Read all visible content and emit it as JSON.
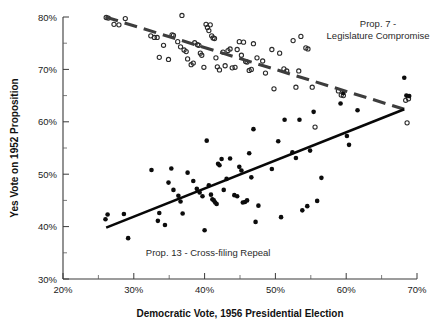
{
  "chart_data": {
    "type": "scatter",
    "title": "",
    "xlabel": "Democratic Vote, 1956 Presidential Election",
    "ylabel": "Yes Vote on 1952 Proposition",
    "xlim": [
      20,
      70
    ],
    "ylim": [
      30,
      80
    ],
    "x_ticks": [
      "20%",
      "30%",
      "40%",
      "50%",
      "60%",
      "70%"
    ],
    "x_tick_values": [
      20,
      30,
      40,
      50,
      60,
      70
    ],
    "x_minor_tick_values": [
      25,
      35,
      45,
      55,
      65
    ],
    "y_ticks": [
      "30%",
      "40%",
      "50%",
      "60%",
      "70%",
      "80%"
    ],
    "y_tick_values": [
      30,
      40,
      50,
      60,
      70,
      80
    ],
    "y_minor_tick_values": [
      35,
      45,
      55,
      65,
      75
    ],
    "grid": false,
    "legend_position": "none",
    "annotations": [
      {
        "name": "prop7-label",
        "lines": [
          "Prop. 7 -",
          "Legislature Compromise"
        ],
        "x": 64.5,
        "y": 78.0,
        "anchor": "middle"
      },
      {
        "name": "prop13-label",
        "lines": [
          "Prop. 13 - Cross-filing Repeal"
        ],
        "x": 40.5,
        "y": 34.3,
        "anchor": "middle"
      }
    ],
    "series": [
      {
        "name": "Prop. 7 - Legislature Compromise",
        "marker": "open-circle",
        "color": "#2b2b2b",
        "points": [
          [
            26.1,
            79.9
          ],
          [
            26.4,
            79.8
          ],
          [
            27.2,
            78.6
          ],
          [
            27.9,
            78.5
          ],
          [
            28.8,
            79.7
          ],
          [
            32.4,
            76.4
          ],
          [
            32.9,
            76.1
          ],
          [
            33.3,
            76.1
          ],
          [
            33.6,
            72.3
          ],
          [
            34.2,
            74.6
          ],
          [
            34.9,
            71.9
          ],
          [
            35.4,
            76.6
          ],
          [
            35.6,
            76.5
          ],
          [
            36.2,
            75.3
          ],
          [
            36.6,
            74.3
          ],
          [
            36.8,
            80.3
          ],
          [
            37.1,
            73.7
          ],
          [
            37.4,
            73.4
          ],
          [
            37.6,
            72.0
          ],
          [
            38.1,
            70.9
          ],
          [
            38.4,
            71.2
          ],
          [
            38.6,
            75.1
          ],
          [
            39.0,
            74.7
          ],
          [
            39.2,
            74.6
          ],
          [
            39.4,
            73.1
          ],
          [
            39.6,
            72.7
          ],
          [
            39.9,
            70.4
          ],
          [
            40.2,
            78.6
          ],
          [
            40.4,
            78.0
          ],
          [
            40.6,
            77.4
          ],
          [
            40.8,
            78.5
          ],
          [
            41.0,
            76.4
          ],
          [
            41.2,
            76.0
          ],
          [
            41.4,
            75.9
          ],
          [
            41.6,
            72.2
          ],
          [
            41.8,
            70.5
          ],
          [
            42.1,
            69.9
          ],
          [
            42.6,
            73.3
          ],
          [
            42.9,
            70.7
          ],
          [
            43.3,
            73.6
          ],
          [
            43.6,
            73.9
          ],
          [
            43.9,
            70.3
          ],
          [
            44.3,
            70.4
          ],
          [
            44.6,
            73.8
          ],
          [
            44.9,
            75.3
          ],
          [
            45.2,
            72.7
          ],
          [
            45.5,
            75.2
          ],
          [
            45.8,
            71.5
          ],
          [
            46.0,
            71.4
          ],
          [
            46.3,
            69.8
          ],
          [
            46.6,
            70.0
          ],
          [
            46.9,
            74.9
          ],
          [
            47.4,
            72.2
          ],
          [
            48.2,
            71.6
          ],
          [
            48.6,
            69.3
          ],
          [
            49.5,
            73.8
          ],
          [
            49.8,
            66.3
          ],
          [
            50.6,
            73.1
          ],
          [
            51.2,
            70.1
          ],
          [
            51.6,
            69.7
          ],
          [
            52.5,
            75.5
          ],
          [
            52.9,
            66.6
          ],
          [
            53.3,
            69.7
          ],
          [
            53.6,
            76.3
          ],
          [
            54.3,
            74.1
          ],
          [
            54.6,
            73.9
          ],
          [
            55.2,
            66.6
          ],
          [
            55.6,
            59.0
          ],
          [
            58.9,
            65.9
          ],
          [
            59.3,
            65.1
          ],
          [
            59.6,
            65.0
          ],
          [
            68.4,
            64.1
          ],
          [
            68.6,
            59.8
          ],
          [
            68.8,
            64.4
          ]
        ]
      },
      {
        "name": "Prop. 13 - Cross-filing Repeal",
        "marker": "filled-circle",
        "color": "#0c0c0c",
        "points": [
          [
            26.0,
            41.4
          ],
          [
            26.3,
            42.3
          ],
          [
            28.6,
            42.4
          ],
          [
            29.2,
            37.8
          ],
          [
            32.5,
            50.8
          ],
          [
            33.4,
            41.1
          ],
          [
            33.6,
            42.6
          ],
          [
            34.4,
            40.3
          ],
          [
            34.9,
            48.4
          ],
          [
            35.3,
            51.1
          ],
          [
            35.6,
            47.0
          ],
          [
            36.3,
            45.9
          ],
          [
            36.6,
            44.8
          ],
          [
            36.9,
            42.5
          ],
          [
            37.6,
            50.3
          ],
          [
            38.4,
            48.7
          ],
          [
            38.9,
            47.2
          ],
          [
            39.3,
            46.5
          ],
          [
            39.7,
            45.8
          ],
          [
            40.0,
            39.3
          ],
          [
            40.3,
            56.4
          ],
          [
            40.6,
            47.9
          ],
          [
            40.9,
            46.1
          ],
          [
            41.1,
            45.2
          ],
          [
            41.3,
            45.0
          ],
          [
            41.5,
            44.6
          ],
          [
            41.7,
            44.3
          ],
          [
            41.9,
            52.0
          ],
          [
            42.1,
            51.7
          ],
          [
            42.4,
            52.9
          ],
          [
            42.7,
            47.0
          ],
          [
            43.1,
            49.1
          ],
          [
            43.6,
            53.0
          ],
          [
            44.2,
            46.0
          ],
          [
            44.6,
            45.8
          ],
          [
            44.9,
            51.4
          ],
          [
            45.2,
            50.7
          ],
          [
            45.4,
            44.6
          ],
          [
            45.7,
            44.7
          ],
          [
            46.0,
            45.0
          ],
          [
            46.3,
            54.0
          ],
          [
            46.6,
            49.4
          ],
          [
            46.9,
            58.6
          ],
          [
            47.2,
            40.9
          ],
          [
            47.6,
            44.0
          ],
          [
            49.5,
            51.0
          ],
          [
            50.4,
            56.3
          ],
          [
            50.8,
            41.8
          ],
          [
            51.3,
            60.4
          ],
          [
            52.4,
            54.2
          ],
          [
            52.9,
            53.1
          ],
          [
            53.4,
            60.4
          ],
          [
            53.8,
            43.1
          ],
          [
            54.5,
            43.9
          ],
          [
            54.9,
            54.5
          ],
          [
            55.4,
            61.9
          ],
          [
            55.9,
            44.9
          ],
          [
            56.5,
            49.3
          ],
          [
            59.2,
            63.5
          ],
          [
            59.6,
            65.5
          ],
          [
            60.1,
            57.3
          ],
          [
            60.4,
            55.6
          ],
          [
            61.6,
            62.2
          ],
          [
            68.2,
            68.4
          ],
          [
            68.5,
            65.0
          ],
          [
            68.9,
            64.9
          ]
        ]
      }
    ],
    "fit_lines": [
      {
        "name": "prop7-trend",
        "style": "dashed",
        "color": "#3d3d3d",
        "x0": 26.0,
        "y0": 80.0,
        "x1": 68.2,
        "y1": 62.4
      },
      {
        "name": "prop13-trend",
        "style": "solid",
        "color": "#080808",
        "x0": 26.1,
        "y0": 39.8,
        "x1": 68.2,
        "y1": 62.4
      }
    ]
  },
  "plot_geometry": {
    "left": 63,
    "right": 417,
    "top": 17,
    "bottom": 279
  }
}
